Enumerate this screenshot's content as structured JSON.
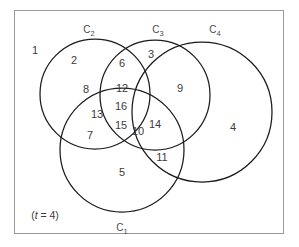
{
  "figure": {
    "kind": "venn-diagram",
    "stroke_color": "#1b1b1b",
    "frame_color": "#9a9a9a",
    "background_color": "#ffffff",
    "text_color": "#3b3b3b"
  },
  "parameter": {
    "text": "(t = 4)",
    "symbol": "t",
    "value": "4"
  },
  "sets": [
    {
      "id": "c1",
      "base": "C",
      "subscript": "1",
      "label": "C1",
      "x": 122,
      "y": 229
    },
    {
      "id": "c2",
      "base": "C",
      "subscript": "2",
      "label": "C2",
      "x": 89,
      "y": 31
    },
    {
      "id": "c3",
      "base": "C",
      "subscript": "3",
      "label": "C3",
      "x": 158,
      "y": 31
    },
    {
      "id": "c4",
      "base": "C",
      "subscript": "4",
      "label": "C4",
      "x": 215,
      "y": 31
    }
  ],
  "regions": [
    {
      "id": "r1",
      "label": "1",
      "x": 35,
      "y": 50,
      "sets": "outside-all"
    },
    {
      "id": "r2",
      "label": "2",
      "x": 74,
      "y": 60,
      "sets": "c2"
    },
    {
      "id": "r3",
      "label": "3",
      "x": 151,
      "y": 54,
      "sets": "c3"
    },
    {
      "id": "r4",
      "label": "4",
      "x": 233,
      "y": 127,
      "sets": "c4"
    },
    {
      "id": "r5",
      "label": "5",
      "x": 122,
      "y": 172,
      "sets": "c1"
    },
    {
      "id": "r6",
      "label": "6",
      "x": 122,
      "y": 63,
      "sets": "c2-c3"
    },
    {
      "id": "r7",
      "label": "7",
      "x": 90,
      "y": 135,
      "sets": "c1-c2"
    },
    {
      "id": "r8",
      "label": "8",
      "x": 86,
      "y": 89,
      "sets": "c2-c4"
    },
    {
      "id": "r9",
      "label": "9",
      "x": 180,
      "y": 88,
      "sets": "c3-c4"
    },
    {
      "id": "r10",
      "label": "10",
      "x": 138,
      "y": 131,
      "sets": "c1-c3"
    },
    {
      "id": "r11",
      "label": "11",
      "x": 162,
      "y": 157,
      "sets": "c1-c4"
    },
    {
      "id": "r12",
      "label": "12",
      "x": 122,
      "y": 88,
      "sets": "c2-c3-c4"
    },
    {
      "id": "r13",
      "label": "13",
      "x": 97,
      "y": 114,
      "sets": "c1-c2-c4"
    },
    {
      "id": "r14",
      "label": "14",
      "x": 155,
      "y": 124,
      "sets": "c1-c3-c4"
    },
    {
      "id": "r15",
      "label": "15",
      "x": 121,
      "y": 125,
      "sets": "c1-c2-c3"
    },
    {
      "id": "r16",
      "label": "16",
      "x": 121,
      "y": 106,
      "sets": "c1-c2-c3-c4"
    }
  ],
  "circles": [
    {
      "id": "c1-circle",
      "name": "circle-c1",
      "cx": 122,
      "cy": 150,
      "r": 62
    },
    {
      "id": "c2-circle",
      "name": "circle-c2",
      "cx": 95,
      "cy": 94,
      "r": 55
    },
    {
      "id": "c3-circle",
      "name": "circle-c3",
      "cx": 155,
      "cy": 95,
      "r": 55
    },
    {
      "id": "c4-circle",
      "name": "circle-c4",
      "cx": 202,
      "cy": 112,
      "r": 70
    }
  ]
}
